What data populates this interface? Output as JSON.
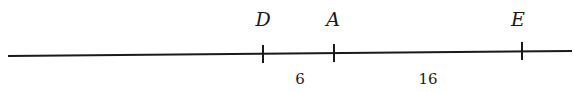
{
  "diagram": {
    "type": "number-line",
    "color": "#1a1a1a",
    "line": {
      "x1": 8,
      "y1": 56,
      "x2": 572,
      "y2": 51
    },
    "points": [
      {
        "label": "D",
        "x": 263
      },
      {
        "label": "A",
        "x": 334
      },
      {
        "label": "E",
        "x": 522
      }
    ],
    "segments": [
      {
        "from": "D",
        "to": "A",
        "length_label": "6"
      },
      {
        "from": "A",
        "to": "E",
        "length_label": "16"
      }
    ]
  }
}
